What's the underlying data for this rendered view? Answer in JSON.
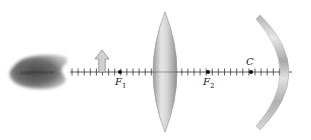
{
  "diagram": {
    "type": "optics-ray-setup",
    "axis": {
      "x_start": 70,
      "x_end": 292,
      "y": 72,
      "tick_spacing": 6.1,
      "color": "#333333"
    },
    "object": {
      "name": "lips",
      "x": 5,
      "width": 63,
      "y": 55,
      "height": 35,
      "color": "#555555"
    },
    "arrow": {
      "x": 102,
      "y_top": 50,
      "y_base": 72,
      "color": "#c8c8c8",
      "stroke": "#8a8a8a"
    },
    "lens": {
      "cx": 165,
      "top": 12,
      "bottom": 132,
      "half_width": 12,
      "fill": "#c9c9c9"
    },
    "mirror": {
      "vertex_x": 292,
      "top_y": 15,
      "bottom_y": 130,
      "color": "#bdbdbd"
    },
    "points": [
      {
        "id": "F1",
        "x": 120,
        "label_main": "F",
        "label_sub": "1",
        "label_pos": "below"
      },
      {
        "id": "F2",
        "x": 208,
        "label_main": "F",
        "label_sub": "2",
        "label_pos": "below"
      },
      {
        "id": "C",
        "x": 251,
        "label_main": "C",
        "label_sub": "",
        "label_pos": "above"
      }
    ]
  }
}
